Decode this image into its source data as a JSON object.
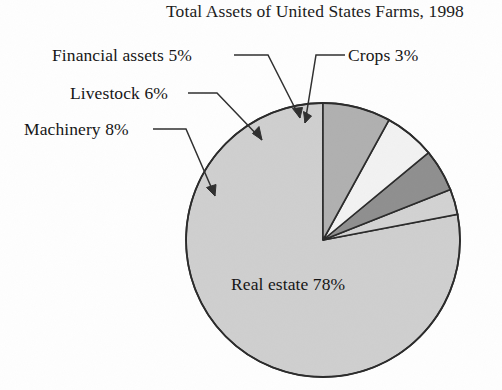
{
  "chart_data": {
    "type": "pie",
    "title": "Total Assets of United States Farms, 1998",
    "xlabel": "",
    "ylabel": "",
    "legend_position": "callout-labels",
    "grid": false,
    "units": "percent",
    "categories": [
      "Real estate",
      "Crops",
      "Financial assets",
      "Livestock",
      "Machinery"
    ],
    "values": [
      78,
      3,
      5,
      6,
      8
    ],
    "start_angle_deg": 90,
    "direction": "counterclockwise",
    "slices": [
      {
        "name": "Real estate",
        "label": "Real estate 78%",
        "value": 78,
        "color": "#cfcfcf",
        "label_placement": "inside"
      },
      {
        "name": "Crops",
        "label": "Crops 3%",
        "value": 3,
        "color": "#d2d2d2",
        "label_placement": "callout-right"
      },
      {
        "name": "Financial assets",
        "label": "Financial assets 5%",
        "value": 5,
        "color": "#8f8f8f",
        "label_placement": "callout-left"
      },
      {
        "name": "Livestock",
        "label": "Livestock 6%",
        "value": 6,
        "color": "#f2f2f2",
        "label_placement": "callout-left"
      },
      {
        "name": "Machinery",
        "label": "Machinery 8%",
        "value": 8,
        "color": "#b0b0b0",
        "label_placement": "callout-left"
      }
    ]
  },
  "title": "Total Assets of United States Farms, 1998",
  "labels": {
    "financial_assets": "Financial assets 5%",
    "livestock": "Livestock 6%",
    "machinery": "Machinery 8%",
    "crops": "Crops 3%",
    "real_estate": "Real estate 78%"
  },
  "colors": {
    "background": "#fefefe",
    "outline": "#2a2a2a",
    "text": "#161616",
    "real_estate": "#cfcfcf",
    "crops": "#d2d2d2",
    "financial_assets": "#8f8f8f",
    "livestock": "#f2f2f2",
    "machinery": "#b0b0b0"
  }
}
